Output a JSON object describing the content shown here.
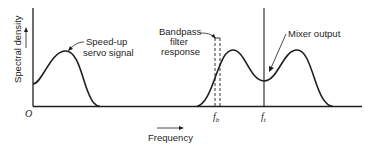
{
  "figure": {
    "y_axis_label": "Spectral density",
    "x_axis_label": "Frequency",
    "origin_label": "O",
    "annotations": {
      "servo_line1": "Speed-up",
      "servo_line2": "servo signal",
      "bandpass_line1": "Bandpass",
      "bandpass_line2": "filter",
      "bandpass_line3": "response",
      "mixer": "Mixer output"
    },
    "tick_labels": {
      "fb": "f",
      "fb_sub": "b",
      "ft": "f",
      "ft_sub": "t"
    },
    "colors": {
      "ink": "#1e1e1e",
      "background": "#ffffff"
    }
  }
}
